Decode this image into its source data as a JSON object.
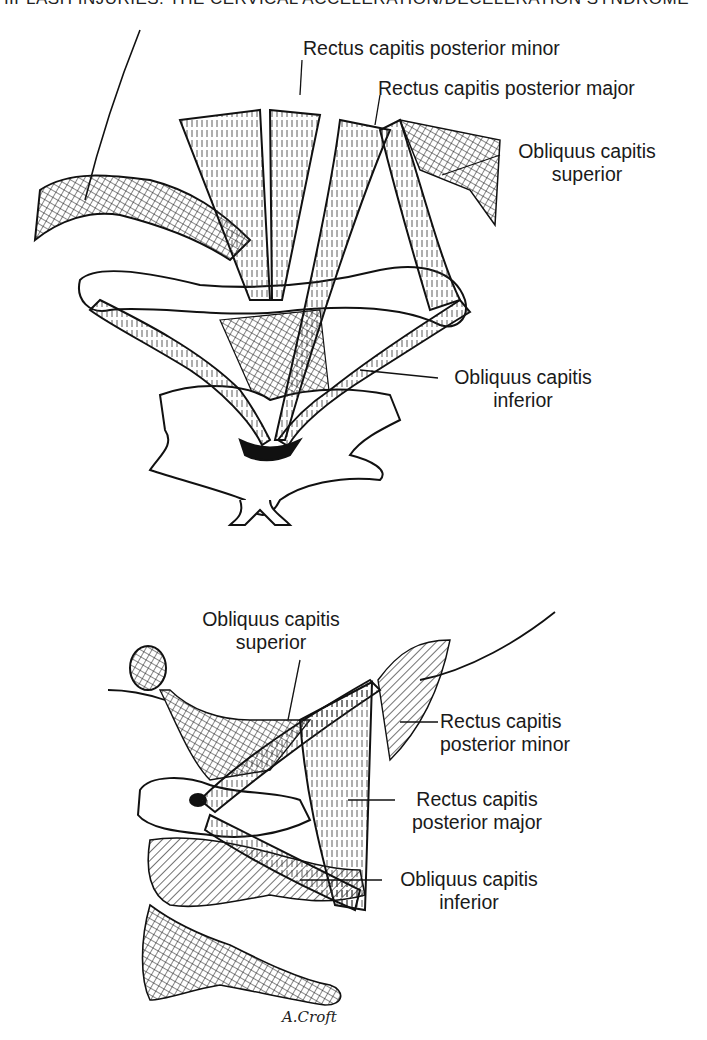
{
  "page": {
    "running_head": "WHIPLASH INJURIES: THE CERVICAL ACCELERATION/DECELERATION SYNDROME"
  },
  "figure_top": {
    "view": "posterior",
    "labels": {
      "rcp_minor": "Rectus capitis posterior minor",
      "rcp_major": "Rectus capitis posterior major",
      "ocs_line1": "Obliquus capitis",
      "ocs_line2": "superior",
      "oci_line1": "Obliquus capitis",
      "oci_line2": "inferior"
    }
  },
  "figure_bottom": {
    "view": "lateral",
    "labels": {
      "ocs_line1": "Obliquus capitis",
      "ocs_line2": "superior",
      "rcp_minor_line1": "Rectus capitis",
      "rcp_minor_line2": "posterior minor",
      "rcp_major_line1": "Rectus capitis",
      "rcp_major_line2": "posterior major",
      "oci_line1": "Obliquus capitis",
      "oci_line2": "inferior"
    },
    "signature": "A.Croft"
  }
}
